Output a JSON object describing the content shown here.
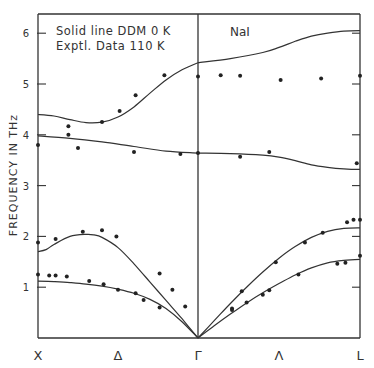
{
  "chart_data": {
    "type": "line",
    "title": "NaI",
    "annotations": [
      "Solid line DDM 0 K",
      "Exptl. Data 110 K"
    ],
    "xlabel": "",
    "ylabel": "FREQUENCY IN THz",
    "ylim": [
      0,
      6.3
    ],
    "yticks": [
      1,
      2,
      3,
      4,
      5,
      6
    ],
    "xlim": [
      0,
      2
    ],
    "xticks": [
      {
        "pos": 0,
        "label": "X"
      },
      {
        "pos": 0.5,
        "label": "Δ"
      },
      {
        "pos": 1,
        "label": "Γ"
      },
      {
        "pos": 1.5,
        "label": "Λ"
      },
      {
        "pos": 2,
        "label": "L"
      }
    ],
    "grid": false,
    "series": [
      {
        "name": "DDM 0 K branch 1 (acoustic TA)",
        "kind": "curve",
        "x": [
          0,
          0.1,
          0.2,
          0.3,
          0.4,
          0.5,
          0.6,
          0.7,
          0.8,
          0.9,
          1.0,
          1.1,
          1.2,
          1.3,
          1.4,
          1.5,
          1.6,
          1.7,
          1.8,
          1.9,
          2.0
        ],
        "y": [
          1.12,
          1.11,
          1.09,
          1.06,
          1.02,
          0.96,
          0.88,
          0.76,
          0.58,
          0.32,
          0.0,
          0.24,
          0.47,
          0.69,
          0.89,
          1.07,
          1.24,
          1.38,
          1.48,
          1.53,
          1.55
        ]
      },
      {
        "name": "DDM 0 K branch 2 (acoustic LA)",
        "kind": "curve",
        "x": [
          0,
          0.05,
          0.1,
          0.2,
          0.3,
          0.35,
          0.4,
          0.5,
          0.6,
          0.7,
          0.8,
          0.9,
          1.0,
          1.1,
          1.2,
          1.3,
          1.4,
          1.5,
          1.6,
          1.7,
          1.8,
          1.9,
          2.0
        ],
        "y": [
          1.7,
          1.74,
          1.84,
          2.0,
          2.04,
          2.03,
          1.98,
          1.78,
          1.46,
          1.1,
          0.74,
          0.38,
          0.0,
          0.34,
          0.68,
          1.0,
          1.3,
          1.57,
          1.8,
          1.98,
          2.1,
          2.16,
          2.17
        ]
      },
      {
        "name": "DDM 0 K branch 3 (optic TO)",
        "kind": "curve",
        "x": [
          0,
          0.2,
          0.4,
          0.6,
          0.8,
          1.0,
          1.2,
          1.4,
          1.5,
          1.6,
          1.7,
          1.8,
          1.9,
          2.0
        ],
        "y": [
          3.98,
          3.93,
          3.86,
          3.77,
          3.68,
          3.64,
          3.63,
          3.6,
          3.56,
          3.49,
          3.41,
          3.36,
          3.33,
          3.32
        ]
      },
      {
        "name": "DDM 0 K branch 4 (optic LO)",
        "kind": "curve",
        "x": [
          0,
          0.1,
          0.2,
          0.3,
          0.4,
          0.5,
          0.6,
          0.7,
          0.8,
          0.9,
          1.0,
          1.2,
          1.4,
          1.5,
          1.6,
          1.7,
          1.8,
          1.9,
          2.0
        ],
        "y": [
          4.4,
          4.37,
          4.3,
          4.24,
          4.25,
          4.35,
          4.55,
          4.82,
          5.08,
          5.28,
          5.42,
          5.5,
          5.62,
          5.72,
          5.84,
          5.94,
          6.0,
          6.04,
          6.05
        ]
      },
      {
        "name": "Exptl. Data 110 K",
        "kind": "points",
        "points": [
          [
            0.0,
            1.25
          ],
          [
            0.07,
            1.23
          ],
          [
            0.11,
            1.23
          ],
          [
            0.18,
            1.21
          ],
          [
            0.32,
            1.12
          ],
          [
            0.41,
            1.06
          ],
          [
            0.5,
            0.95
          ],
          [
            0.61,
            0.88
          ],
          [
            0.66,
            0.75
          ],
          [
            0.76,
            0.6
          ],
          [
            0.0,
            1.88
          ],
          [
            0.11,
            1.95
          ],
          [
            0.28,
            2.09
          ],
          [
            0.4,
            2.12
          ],
          [
            0.49,
            2.0
          ],
          [
            0.76,
            1.27
          ],
          [
            0.84,
            0.95
          ],
          [
            0.92,
            0.62
          ],
          [
            1.21,
            0.58
          ],
          [
            1.27,
            0.92
          ],
          [
            1.48,
            1.49
          ],
          [
            1.66,
            1.88
          ],
          [
            1.77,
            2.07
          ],
          [
            1.92,
            2.28
          ],
          [
            1.96,
            2.33
          ],
          [
            2.0,
            2.33
          ],
          [
            1.21,
            0.55
          ],
          [
            1.3,
            0.7
          ],
          [
            1.4,
            0.85
          ],
          [
            1.44,
            0.94
          ],
          [
            1.62,
            1.25
          ],
          [
            1.86,
            1.46
          ],
          [
            1.91,
            1.48
          ],
          [
            2.0,
            1.62
          ],
          [
            0.0,
            3.8
          ],
          [
            0.19,
            4.0
          ],
          [
            0.25,
            3.74
          ],
          [
            0.6,
            3.66
          ],
          [
            0.89,
            3.62
          ],
          [
            1.0,
            3.64
          ],
          [
            1.26,
            3.57
          ],
          [
            1.44,
            3.66
          ],
          [
            1.98,
            3.44
          ],
          [
            0.19,
            4.17
          ],
          [
            0.4,
            4.25
          ],
          [
            0.51,
            4.47
          ],
          [
            0.61,
            4.78
          ],
          [
            0.79,
            5.17
          ],
          [
            1.0,
            5.15
          ],
          [
            1.14,
            5.17
          ],
          [
            1.26,
            5.16
          ],
          [
            1.51,
            5.08
          ],
          [
            1.76,
            5.11
          ],
          [
            2.0,
            5.16
          ]
        ]
      }
    ]
  }
}
